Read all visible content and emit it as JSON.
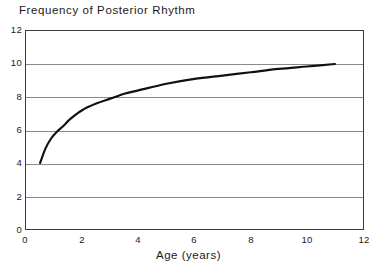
{
  "chart_data": {
    "type": "line",
    "title": "Frequency of Posterior Rhythm",
    "xlabel": "Age (years)",
    "ylabel": "",
    "xlim": [
      0,
      12
    ],
    "ylim": [
      0,
      12
    ],
    "xticks": [
      "0",
      "2",
      "4",
      "6",
      "8",
      "10",
      "12"
    ],
    "yticks": [
      "0",
      "2",
      "4",
      "6",
      "8",
      "10",
      "12"
    ],
    "grid": "horizontal",
    "legend": "none",
    "series": [
      {
        "name": "Posterior rhythm frequency",
        "x": [
          0.5,
          0.7,
          0.9,
          1.1,
          1.3,
          1.6,
          2.0,
          2.5,
          3.0,
          3.5,
          4.0,
          5.0,
          6.0,
          7.0,
          8.0,
          9.0,
          10.0,
          11.0
        ],
        "values": [
          4.0,
          4.9,
          5.5,
          5.9,
          6.2,
          6.7,
          7.2,
          7.6,
          7.9,
          8.2,
          8.4,
          8.8,
          9.1,
          9.3,
          9.5,
          9.7,
          9.85,
          10.0
        ],
        "color": "#111111"
      }
    ],
    "annotations": []
  },
  "style": {
    "frame_color": "#3a3a3a",
    "grid_color": "#8a8a8a",
    "background": "#ffffff",
    "curve_color": "#111111"
  }
}
